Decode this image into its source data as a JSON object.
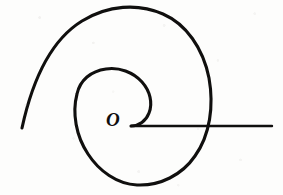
{
  "figure": {
    "kind": "hand-drawn-spiral-diagram",
    "background_color": "#fdfdfc",
    "ink_color": "#100f0e",
    "width": 283,
    "height": 195,
    "origin_label": "O",
    "origin_point": {
      "x": 131,
      "y": 126
    },
    "label_position": {
      "x": 106,
      "y": 110
    },
    "stroke_widths": {
      "spiral": 3.1,
      "axis": 2.4
    }
  },
  "chart_data": {
    "type": "line",
    "title": "",
    "subtitle": "",
    "xlabel": "",
    "ylabel": "",
    "grid": false,
    "legend": "none",
    "coordinate_system": "polar",
    "annotations": [
      {
        "text": "O",
        "x": 131,
        "y": 126,
        "role": "pole-label"
      }
    ],
    "series": [
      {
        "name": "spiral",
        "curve_type": "archimedean-spiral",
        "turns": 1.75,
        "description": "Spiral starting at the pole O, winding counter-clockwise outward through about one and three quarter turns, ending as a free tail at lower left.",
        "path": "M 131 126 C 139 126 146 121 149 113 C 153 103 150 91 142 82 C 133 72 119 67 106 69 C 91 71 80 80 77 94 C 72 113 76 136 88 154 C 99 171 117 184 137 185 C 160 186 182 175 195 156 C 210 135 214 106 209 78 C 203 48 186 24 163 14 C 138 3 108 5 82 21 C 56 37 35 68 22 128",
        "points_polar": [
          {
            "theta_deg": 0,
            "r": 0
          },
          {
            "theta_deg": 45,
            "r": 20
          },
          {
            "theta_deg": 90,
            "r": 30
          },
          {
            "theta_deg": 135,
            "r": 42
          },
          {
            "theta_deg": 180,
            "r": 54
          },
          {
            "theta_deg": 225,
            "r": 58
          },
          {
            "theta_deg": 270,
            "r": 60
          },
          {
            "theta_deg": 315,
            "r": 70
          },
          {
            "theta_deg": 360,
            "r": 82
          },
          {
            "theta_deg": 405,
            "r": 100
          },
          {
            "theta_deg": 450,
            "r": 113
          },
          {
            "theta_deg": 495,
            "r": 122
          },
          {
            "theta_deg": 540,
            "r": 128
          },
          {
            "theta_deg": 585,
            "r": 125
          },
          {
            "theta_deg": 630,
            "r": 118
          }
        ],
        "extents": {
          "top_y": 11,
          "bottom_y": 185,
          "left_x": 22,
          "right_x": 213
        },
        "free_end": {
          "x": 22,
          "y": 128
        }
      },
      {
        "name": "polar-axis",
        "curve_type": "ray",
        "description": "Horizontal initial-line (polar axis) drawn from the pole O rightwards, crossing the outer spiral turn and running off toward the right.",
        "from": {
          "x": 131,
          "y": 126
        },
        "to": {
          "x": 272,
          "y": 126
        },
        "crosses_spiral_at_x": 205
      }
    ]
  }
}
